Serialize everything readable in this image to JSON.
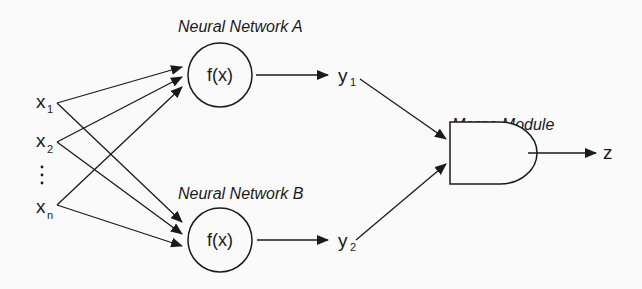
{
  "diagram": {
    "type": "ensemble-network-diagram",
    "inputs": [
      {
        "base": "x",
        "sub": "1"
      },
      {
        "base": "x",
        "sub": "2"
      },
      {
        "ellipsis": "⋮"
      },
      {
        "base": "x",
        "sub": "n"
      }
    ],
    "network_a": {
      "title": "Neural Network A",
      "function": "f(x)",
      "output_base": "y",
      "output_sub": "1"
    },
    "network_b": {
      "title": "Neural Network B",
      "function": "f(x)",
      "output_base": "y",
      "output_sub": "2"
    },
    "merge": {
      "title": "Merge Module",
      "output": "z"
    },
    "colors": {
      "stroke": "#1a1a1a",
      "background": "#fafafa"
    }
  }
}
